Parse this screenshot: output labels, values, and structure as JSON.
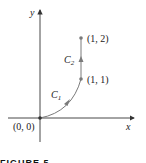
{
  "figure": {
    "axes": {
      "x_label": "x",
      "y_label": "y"
    },
    "points": [
      {
        "label": "(0, 0)"
      },
      {
        "label": "(1, 1)"
      },
      {
        "label": "(1, 2)"
      }
    ],
    "curves": [
      {
        "label": "C",
        "subscript": "1"
      },
      {
        "label": "C",
        "subscript": "2"
      }
    ],
    "caption": "FIGURE 5",
    "colors": {
      "curve": "#7a7a7a",
      "axis": "#333333",
      "text": "#222222"
    }
  }
}
